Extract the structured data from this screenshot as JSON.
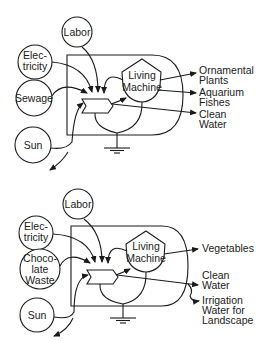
{
  "diagrams": [
    {
      "name": "sewage-living-machine",
      "sources": {
        "labor": "Labor",
        "electricity": [
          "Elec-",
          "tricity"
        ],
        "input": [
          "Sewage"
        ],
        "sun": "Sun"
      },
      "process": [
        "Living",
        "Machine"
      ],
      "outputs": [
        [
          "Ornamental",
          "Plants"
        ],
        [
          "Aquarium",
          "Fishes"
        ],
        [
          "Clean",
          "Water"
        ]
      ]
    },
    {
      "name": "chocolate-waste-living-machine",
      "sources": {
        "labor": "Labor",
        "electricity": [
          "Elec-",
          "tricity"
        ],
        "input": [
          "Choco-",
          "late",
          "Waste"
        ],
        "sun": "Sun"
      },
      "process": [
        "Living",
        "Machine"
      ],
      "outputs": [
        [
          "Vegetables"
        ],
        [
          "Clean",
          "Water"
        ],
        [
          "Irrigation",
          "Water for",
          "Landscape"
        ]
      ]
    }
  ]
}
